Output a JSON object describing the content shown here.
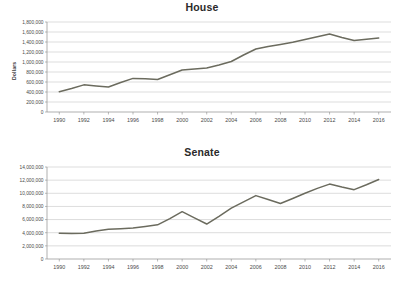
{
  "chart_data": [
    {
      "type": "line",
      "title": "House",
      "xlabel": "",
      "ylabel": "Dollars",
      "x": [
        1990,
        1991,
        1992,
        1993,
        1994,
        1995,
        1996,
        1997,
        1998,
        1999,
        2000,
        2001,
        2002,
        2003,
        2004,
        2005,
        2006,
        2007,
        2008,
        2009,
        2010,
        2011,
        2012,
        2013,
        2014,
        2015,
        2016
      ],
      "xtick_labels": [
        "1990",
        "1992",
        "1994",
        "1996",
        "1998",
        "2000",
        "2002",
        "2004",
        "2006",
        "2008",
        "2010",
        "2012",
        "2014",
        "2016"
      ],
      "xtick_values": [
        1990,
        1992,
        1994,
        1996,
        1998,
        2000,
        2002,
        2004,
        2006,
        2008,
        2010,
        2012,
        2014,
        2016
      ],
      "ytick_labels": [
        "0",
        "200,000",
        "400,000",
        "600,000",
        "800,000",
        "1,000,000",
        "1,200,000",
        "1,400,000",
        "1,600,000",
        "1,800,000"
      ],
      "ytick_values": [
        0,
        200000,
        400000,
        600000,
        800000,
        1000000,
        1200000,
        1400000,
        1600000,
        1800000
      ],
      "values": [
        407000,
        470000,
        543000,
        520000,
        500000,
        590000,
        672000,
        663000,
        650000,
        745000,
        840000,
        862000,
        880000,
        940000,
        1010000,
        1140000,
        1260000,
        1310000,
        1350000,
        1395000,
        1450000,
        1505000,
        1560000,
        1490000,
        1428000,
        1455000,
        1480000
      ],
      "series": [
        {
          "name": "House",
          "values": [
            407000,
            470000,
            543000,
            520000,
            500000,
            590000,
            672000,
            663000,
            650000,
            745000,
            840000,
            862000,
            880000,
            940000,
            1010000,
            1140000,
            1260000,
            1310000,
            1350000,
            1395000,
            1450000,
            1505000,
            1560000,
            1490000,
            1428000,
            1455000,
            1480000
          ],
          "color": "#6b6b5e"
        }
      ],
      "ylim": [
        0,
        1800000
      ],
      "xlim": [
        1989,
        2017
      ],
      "grid": true,
      "legend": "none"
    },
    {
      "type": "line",
      "title": "Senate",
      "xlabel": "",
      "ylabel": "Dollars",
      "x": [
        1990,
        1991,
        1992,
        1993,
        1994,
        1995,
        1996,
        1997,
        1998,
        1999,
        2000,
        2001,
        2002,
        2003,
        2004,
        2005,
        2006,
        2007,
        2008,
        2009,
        2010,
        2011,
        2012,
        2013,
        2014,
        2015,
        2016
      ],
      "xtick_labels": [
        "1990",
        "1992",
        "1994",
        "1996",
        "1998",
        "2000",
        "2002",
        "2004",
        "2006",
        "2008",
        "2010",
        "2012",
        "2014",
        "2016"
      ],
      "xtick_values": [
        1990,
        1992,
        1994,
        1996,
        1998,
        2000,
        2002,
        2004,
        2006,
        2008,
        2010,
        2012,
        2014,
        2016
      ],
      "ytick_labels": [
        "0",
        "2,000,000",
        "4,000,000",
        "6,000,000",
        "8,000,000",
        "10,000,000",
        "12,000,000",
        "14,000,000"
      ],
      "ytick_values": [
        0,
        2000000,
        4000000,
        6000000,
        8000000,
        10000000,
        12000000,
        14000000
      ],
      "values": [
        3900000,
        3880000,
        3930000,
        4250000,
        4520000,
        4600000,
        4720000,
        4950000,
        5200000,
        6150000,
        7200000,
        6250000,
        5320000,
        6500000,
        7750000,
        8700000,
        9650000,
        9050000,
        8450000,
        9200000,
        10000000,
        10750000,
        11400000,
        10950000,
        10550000,
        11300000,
        12100000
      ],
      "series": [
        {
          "name": "Senate",
          "values": [
            3900000,
            3880000,
            3930000,
            4250000,
            4520000,
            4600000,
            4720000,
            4950000,
            5200000,
            6150000,
            7200000,
            6250000,
            5320000,
            6500000,
            7750000,
            8700000,
            9650000,
            9050000,
            8450000,
            9200000,
            10000000,
            10750000,
            11400000,
            10950000,
            10550000,
            11300000,
            12100000
          ],
          "color": "#6b6b5e"
        }
      ],
      "ylim": [
        0,
        14000000
      ],
      "xlim": [
        1989,
        2017
      ],
      "grid": true,
      "legend": "none"
    }
  ]
}
